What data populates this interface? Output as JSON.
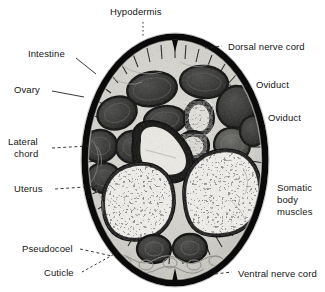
{
  "figure": {
    "background_color": "#ffffff",
    "label_color": "#151515",
    "specimen": {
      "type": "histological-cross-section",
      "outline_shape": "oval",
      "cuticle_color": "#0d0d0d",
      "body_fill": "#d8d6d0",
      "organ_dark": "#2c2c2c",
      "organ_mid": "#5a5a58",
      "lumen_light": "#efeeea"
    }
  },
  "labels": [
    {
      "id": "hypodermis",
      "text": "Hypodermis",
      "lines": [
        "Hypodermis"
      ]
    },
    {
      "id": "dorsal-nerve-cord",
      "text": "Dorsal nerve cord",
      "lines": [
        "Dorsal nerve cord"
      ]
    },
    {
      "id": "intestine",
      "text": "Intestine",
      "lines": [
        "Intestine"
      ]
    },
    {
      "id": "ovary",
      "text": "Ovary",
      "lines": [
        "Ovary"
      ]
    },
    {
      "id": "oviduct-upper",
      "text": "Oviduct",
      "lines": [
        "Oviduct"
      ]
    },
    {
      "id": "oviduct-lower",
      "text": "Oviduct",
      "lines": [
        "Oviduct"
      ]
    },
    {
      "id": "lateral-chord",
      "text": "Lateral chord",
      "lines": [
        "Lateral",
        "chord"
      ]
    },
    {
      "id": "uterus",
      "text": "Uterus",
      "lines": [
        "Uterus"
      ]
    },
    {
      "id": "somatic-body-muscles",
      "text": "Somatic body muscles",
      "lines": [
        "Somatic",
        "body",
        "muscles"
      ]
    },
    {
      "id": "pseudocoel",
      "text": "Pseudocoel",
      "lines": [
        "Pseudocoel"
      ]
    },
    {
      "id": "cuticle",
      "text": "Cuticle",
      "lines": [
        "Cuticle"
      ]
    },
    {
      "id": "ventral-nerve-cord",
      "text": "Ventral nerve cord",
      "lines": [
        "Ventral nerve cord"
      ]
    }
  ],
  "label_text": {
    "hypodermis": "Hypodermis",
    "dorsal_nerve_cord": "Dorsal nerve cord",
    "intestine": "Intestine",
    "ovary": "Ovary",
    "oviduct_upper": "Oviduct",
    "oviduct_lower": "Oviduct",
    "lateral_chord_1": "Lateral",
    "lateral_chord_2": "chord",
    "uterus": "Uterus",
    "somatic_1": "Somatic",
    "somatic_2": "body",
    "somatic_3": "muscles",
    "pseudocoel": "Pseudocoel",
    "cuticle": "Cuticle",
    "ventral_nerve_cord": "Ventral nerve cord"
  }
}
